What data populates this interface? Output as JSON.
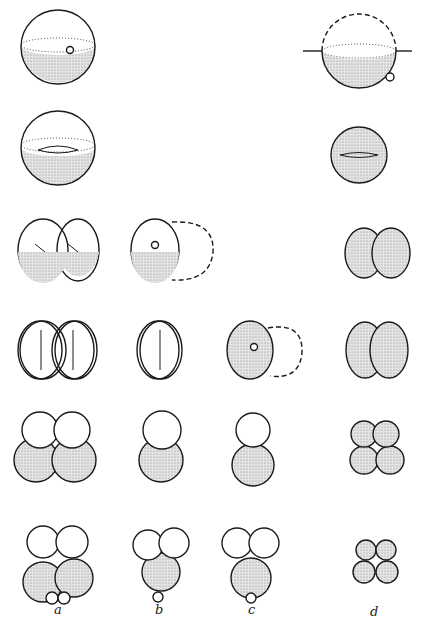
{
  "figure": {
    "columns": [
      {
        "id": "a",
        "label": "a"
      },
      {
        "id": "b",
        "label": "b"
      },
      {
        "id": "c",
        "label": "c"
      },
      {
        "id": "d",
        "label": "d"
      }
    ],
    "rows": 6,
    "colors": {
      "stroke": "#1a1a1a",
      "stipple": "#bdbdbd",
      "background": "#ffffff"
    }
  }
}
